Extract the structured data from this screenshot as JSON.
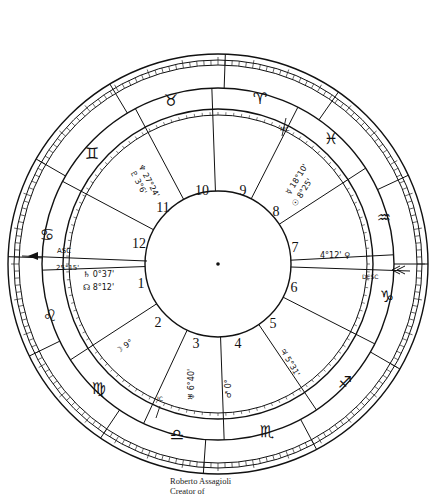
{
  "caption": {
    "name": "Roberto Assagioli",
    "subtitle": "Creator of"
  },
  "chart": {
    "center": [
      218,
      264
    ],
    "radii": {
      "outer": 210,
      "outer_inner": 198,
      "sign_ring_inner": 176,
      "house_ring_outer": 154,
      "house_ring_inner": 147,
      "core": 72
    },
    "angles": {
      "asc": {
        "label": "ASC",
        "value": "25°15'"
      },
      "desc": {
        "label": "DESC"
      },
      "mc": {
        "label": "MC"
      },
      "ic": {
        "label": "IC"
      }
    },
    "houses": [
      "1",
      "2",
      "3",
      "4",
      "5",
      "6",
      "7",
      "8",
      "9",
      "10",
      "11",
      "12"
    ],
    "signs": [
      {
        "name": "Aries",
        "glyph": "♈"
      },
      {
        "name": "Taurus",
        "glyph": "♉"
      },
      {
        "name": "Gemini",
        "glyph": "♊"
      },
      {
        "name": "Cancer",
        "glyph": "♋"
      },
      {
        "name": "Leo",
        "glyph": "♌"
      },
      {
        "name": "Virgo",
        "glyph": "♍"
      },
      {
        "name": "Libra",
        "glyph": "♎"
      },
      {
        "name": "Scorpio",
        "glyph": "♏"
      },
      {
        "name": "Sagittarius",
        "glyph": "♐"
      },
      {
        "name": "Capricorn",
        "glyph": "♑"
      },
      {
        "name": "Aquarius",
        "glyph": "♒"
      },
      {
        "name": "Pisces",
        "glyph": "♓"
      }
    ],
    "placements": [
      {
        "house": "11",
        "text": "♆ 27°24'"
      },
      {
        "house": "11",
        "text": "♇ 3°6'"
      },
      {
        "house": "8",
        "text": "☿ 18°10'"
      },
      {
        "house": "8",
        "text": "☉ 8°25'"
      },
      {
        "house": "7",
        "text": "4°12' ♀"
      },
      {
        "house": "1",
        "text": "♄ 0°37'"
      },
      {
        "house": "1",
        "text": "☊ 8°12'"
      },
      {
        "house": "2",
        "text": "☽ 9°"
      },
      {
        "house": "3",
        "text": "♅ 6°40'"
      },
      {
        "house": "4",
        "text": "♂ 0°"
      },
      {
        "house": "5",
        "text": "♃ 5°31'"
      }
    ]
  }
}
